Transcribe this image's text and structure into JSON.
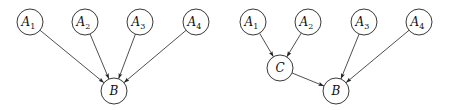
{
  "diagrams": [
    {
      "id": "left",
      "nodes": [
        {
          "id": "A1",
          "label": "A",
          "sub": "1",
          "x": 30,
          "y": 22
        },
        {
          "id": "A2",
          "label": "A",
          "sub": "2",
          "x": 85,
          "y": 22
        },
        {
          "id": "A3",
          "label": "A",
          "sub": "3",
          "x": 140,
          "y": 22
        },
        {
          "id": "A4",
          "label": "A",
          "sub": "4",
          "x": 196,
          "y": 22
        },
        {
          "id": "B",
          "label": "B",
          "sub": "",
          "x": 114,
          "y": 91
        }
      ],
      "edges": [
        {
          "from": "A1",
          "to": "B"
        },
        {
          "from": "A2",
          "to": "B"
        },
        {
          "from": "A3",
          "to": "B"
        },
        {
          "from": "A4",
          "to": "B"
        }
      ]
    },
    {
      "id": "right",
      "nodes": [
        {
          "id": "A1",
          "label": "A",
          "sub": "1",
          "x": 253,
          "y": 22
        },
        {
          "id": "A2",
          "label": "A",
          "sub": "2",
          "x": 308,
          "y": 22
        },
        {
          "id": "A3",
          "label": "A",
          "sub": "3",
          "x": 364,
          "y": 22
        },
        {
          "id": "A4",
          "label": "A",
          "sub": "4",
          "x": 419,
          "y": 22
        },
        {
          "id": "C",
          "label": "C",
          "sub": "",
          "x": 280,
          "y": 68
        },
        {
          "id": "B",
          "label": "B",
          "sub": "",
          "x": 336,
          "y": 91
        }
      ],
      "edges": [
        {
          "from": "A1",
          "to": "C"
        },
        {
          "from": "A2",
          "to": "C"
        },
        {
          "from": "C",
          "to": "B"
        },
        {
          "from": "A3",
          "to": "B"
        },
        {
          "from": "A4",
          "to": "B"
        }
      ]
    }
  ],
  "style": {
    "node_radius": 13,
    "stroke_color": "#222222",
    "fill_color": "#ffffff"
  }
}
